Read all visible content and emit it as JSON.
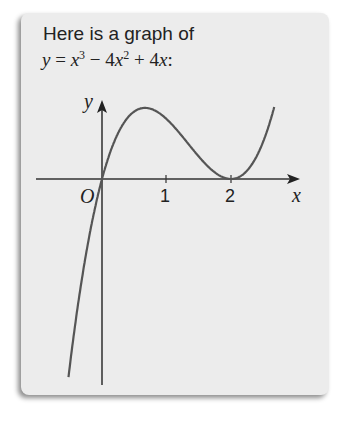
{
  "card": {
    "title": "Here is a graph of",
    "equation": {
      "lhs": "y",
      "eq": " = ",
      "t1": "x",
      "t1_exp": "3",
      "op1": " − 4",
      "t2": "x",
      "t2_exp": "2",
      "op2": " + 4",
      "t3": "x",
      "end": ":"
    }
  },
  "chart_data": {
    "type": "line",
    "xlabel": "x",
    "ylabel": "y",
    "origin_label": "O",
    "x_ticks": [
      "1",
      "2"
    ],
    "x_tick_values": [
      1,
      2
    ],
    "xlim": [
      -1.0,
      3.0
    ],
    "ylim": [
      -4.5,
      1.4
    ],
    "grid": false,
    "legend": null,
    "series": [
      {
        "name": "y = x^3 - 4x^2 + 4x",
        "x": [
          -1.0,
          -0.75,
          -0.5,
          -0.25,
          0,
          0.25,
          0.5,
          0.667,
          0.75,
          1.0,
          1.25,
          1.5,
          1.75,
          2.0,
          2.25,
          2.5,
          2.75,
          3.0
        ],
        "y": [
          -9.0,
          -5.67,
          -3.13,
          -1.27,
          0,
          0.77,
          1.13,
          1.19,
          1.17,
          1.0,
          0.7,
          0.38,
          0.11,
          0,
          0.14,
          0.63,
          1.52,
          3.0
        ]
      }
    ],
    "annotations": [
      "roots at x = 0 and x = 2 (double root, touches axis)",
      "local max near x = 2/3"
    ]
  }
}
